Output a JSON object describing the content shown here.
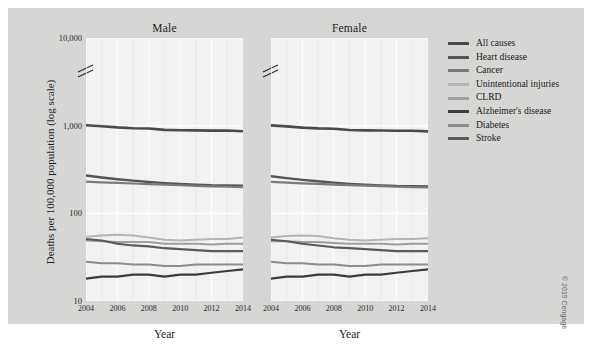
{
  "figure": {
    "copyright": "© 2019 Cengage",
    "background_color": "#d6d6d4",
    "panel_color": "#f2f2f0"
  },
  "chart_data": {
    "type": "line",
    "title": "",
    "xlabel": "Year",
    "ylabel": "Deaths per 100,000 population (log scale)",
    "yscale": "log",
    "ylim": [
      10,
      10000
    ],
    "yticks": [
      "10",
      "100",
      "1,000",
      "10,000"
    ],
    "ytick_values": [
      10,
      100,
      1000,
      10000
    ],
    "axis_break": true,
    "grid": true,
    "legend_position": "right",
    "xlim": [
      2004,
      2014
    ],
    "x": [
      2004,
      2005,
      2006,
      2007,
      2008,
      2009,
      2010,
      2011,
      2012,
      2013,
      2014
    ],
    "xticks": [
      "2004",
      "2006",
      "2008",
      "2010",
      "2012",
      "2014"
    ],
    "xtick_values": [
      2004,
      2006,
      2008,
      2010,
      2012,
      2014
    ],
    "panels": [
      {
        "name": "Male",
        "series": [
          {
            "name": "All causes",
            "color": "#4a4a4a",
            "width": 2.6,
            "values": [
              1011,
              985,
              955,
              936,
              927,
              895,
              888,
              884,
              878,
              880,
              863
            ]
          },
          {
            "name": "Heart disease",
            "color": "#555555",
            "width": 2.4,
            "values": [
              270,
              256,
              245,
              236,
              228,
              221,
              216,
              212,
              209,
              208,
              206
            ]
          },
          {
            "name": "Cancer",
            "color": "#7a7a7a",
            "width": 2.2,
            "values": [
              230,
              226,
              222,
              219,
              215,
              212,
              209,
              206,
              203,
              201,
              199
            ]
          },
          {
            "name": "Unintentional injuries",
            "color": "#b4b4b4",
            "width": 2.0,
            "values": [
              54,
              56,
              57,
              56,
              53,
              50,
              49,
              50,
              51,
              51,
              53
            ]
          },
          {
            "name": "CLRD",
            "color": "#9e9e9e",
            "width": 2.0,
            "values": [
              49,
              48,
              47,
              47,
              47,
              45,
              45,
              45,
              44,
              45,
              45
            ]
          },
          {
            "name": "Alzheimer's disease",
            "color": "#3c3c3c",
            "width": 2.2,
            "values": [
              18,
              19,
              19,
              20,
              20,
              19,
              20,
              20,
              21,
              22,
              23
            ]
          },
          {
            "name": "Diabetes",
            "color": "#8c8c8c",
            "width": 2.0,
            "values": [
              28,
              27,
              27,
              26,
              26,
              25,
              25,
              26,
              26,
              26,
              26
            ]
          },
          {
            "name": "Stroke",
            "color": "#5a5a5a",
            "width": 2.2,
            "values": [
              51,
              49,
              45,
              43,
              42,
              40,
              39,
              38,
              37,
              37,
              37
            ]
          }
        ]
      },
      {
        "name": "Female",
        "series": [
          {
            "name": "All causes",
            "color": "#4a4a4a",
            "width": 2.6,
            "values": [
              1008,
              982,
              951,
              931,
              922,
              893,
              884,
              880,
              874,
              876,
              860
            ]
          },
          {
            "name": "Heart disease",
            "color": "#555555",
            "width": 2.4,
            "values": [
              265,
              252,
              241,
              232,
              224,
              217,
              212,
              208,
              205,
              204,
              202
            ]
          },
          {
            "name": "Cancer",
            "color": "#7a7a7a",
            "width": 2.2,
            "values": [
              228,
              224,
              220,
              217,
              213,
              210,
              207,
              204,
              201,
              199,
              197
            ]
          },
          {
            "name": "Unintentional injuries",
            "color": "#b4b4b4",
            "width": 2.0,
            "values": [
              53,
              55,
              56,
              55,
              52,
              50,
              49,
              50,
              51,
              51,
              52
            ]
          },
          {
            "name": "CLRD",
            "color": "#9e9e9e",
            "width": 2.0,
            "values": [
              48,
              48,
              47,
              47,
              46,
              45,
              45,
              45,
              44,
              45,
              45
            ]
          },
          {
            "name": "Alzheimer's disease",
            "color": "#3c3c3c",
            "width": 2.2,
            "values": [
              18,
              19,
              19,
              20,
              20,
              19,
              20,
              20,
              21,
              22,
              23
            ]
          },
          {
            "name": "Diabetes",
            "color": "#8c8c8c",
            "width": 2.0,
            "values": [
              28,
              27,
              27,
              26,
              26,
              25,
              25,
              26,
              26,
              26,
              26
            ]
          },
          {
            "name": "Stroke",
            "color": "#5a5a5a",
            "width": 2.2,
            "values": [
              50,
              48,
              45,
              43,
              41,
              40,
              39,
              38,
              37,
              37,
              37
            ]
          }
        ]
      }
    ],
    "legend": [
      {
        "label": "All causes",
        "color": "#4a4a4a"
      },
      {
        "label": "Heart disease",
        "color": "#555555"
      },
      {
        "label": "Cancer",
        "color": "#7a7a7a"
      },
      {
        "label": "Unintentional injuries",
        "color": "#b4b4b4"
      },
      {
        "label": "CLRD",
        "color": "#9e9e9e"
      },
      {
        "label": "Alzheimer's disease",
        "color": "#3c3c3c"
      },
      {
        "label": "Diabetes",
        "color": "#8c8c8c"
      },
      {
        "label": "Stroke",
        "color": "#5a5a5a"
      }
    ]
  }
}
